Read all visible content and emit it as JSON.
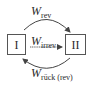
{
  "diagram": {
    "states": [
      {
        "id": "I",
        "label": "I"
      },
      {
        "id": "II",
        "label": "II"
      }
    ],
    "transitions": [
      {
        "from": "I",
        "to": "II",
        "symbol": "W",
        "subscript": "rev",
        "path": "upper-arc"
      },
      {
        "from": "I",
        "to": "II",
        "symbol": "W",
        "subscript": "irrev",
        "path": "straight"
      },
      {
        "from": "II",
        "to": "I",
        "symbol": "W",
        "subscript": "rück (rev)",
        "path": "lower-arc"
      }
    ],
    "colors": {
      "line": "#444444",
      "text": "#2a2a2a",
      "background": "#ffffff"
    }
  }
}
